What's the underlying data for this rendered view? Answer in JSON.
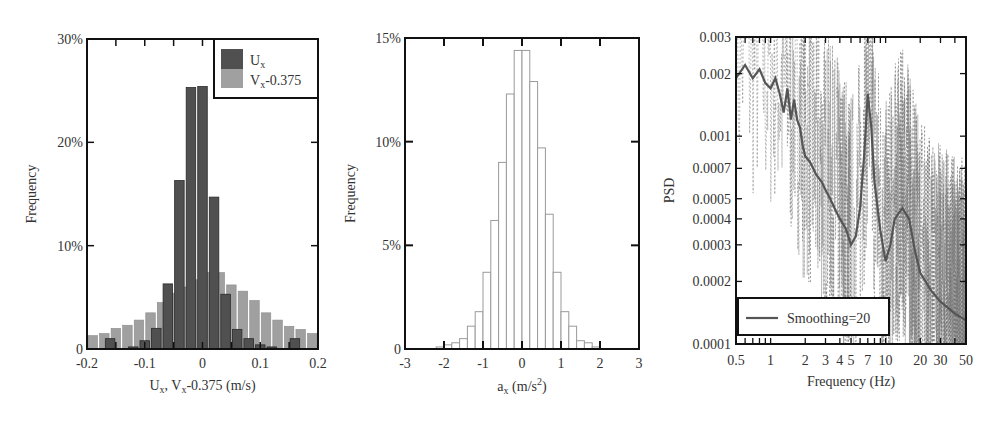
{
  "chart_data": [
    {
      "type": "bar",
      "title": "",
      "xlabel": "U_x, V_x-0.375 (m/s)",
      "ylabel": "Frequency",
      "xlim": [
        -0.2,
        0.2
      ],
      "ylim": [
        0,
        30
      ],
      "x_ticks": [
        "-0.2",
        "-0.1",
        "0",
        "0.1",
        "0.2"
      ],
      "y_ticks": [
        "0",
        "10%",
        "20%",
        "30%"
      ],
      "legend_position": "upper right",
      "series": [
        {
          "name": "U_x",
          "color": "#505050",
          "x": [
            -0.16,
            -0.12,
            -0.1,
            -0.08,
            -0.06,
            -0.04,
            -0.02,
            0.0,
            0.02,
            0.04,
            0.06,
            0.08,
            0.1,
            0.12,
            0.16
          ],
          "values": [
            1.0,
            0.2,
            0.8,
            2.0,
            6.3,
            16.3,
            25.3,
            25.4,
            14.7,
            5.3,
            1.9,
            1.0,
            0.4,
            0.2,
            1.0
          ]
        },
        {
          "name": "V_x-0.375",
          "color": "#a0a0a0",
          "x": [
            -0.19,
            -0.17,
            -0.15,
            -0.13,
            -0.11,
            -0.09,
            -0.07,
            -0.05,
            -0.03,
            -0.01,
            0.01,
            0.03,
            0.05,
            0.07,
            0.09,
            0.11,
            0.13,
            0.15,
            0.17,
            0.19
          ],
          "values": [
            1.3,
            1.5,
            2.0,
            2.3,
            2.8,
            3.5,
            4.5,
            5.4,
            6.0,
            6.7,
            7.4,
            7.4,
            6.2,
            5.6,
            4.7,
            3.5,
            2.8,
            2.2,
            1.9,
            1.5
          ]
        }
      ]
    },
    {
      "type": "bar",
      "title": "",
      "xlabel": "a_x (m/s^2)",
      "ylabel": "Frequency",
      "xlim": [
        -3,
        3
      ],
      "ylim": [
        0,
        15
      ],
      "x_ticks": [
        "-3",
        "-2",
        "-1",
        "0",
        "1",
        "2",
        "3"
      ],
      "y_ticks": [
        "0",
        "5%",
        "10%",
        "15%"
      ],
      "series": [
        {
          "name": "a_x",
          "color": "#ffffff",
          "edge_color": "#9a9a9a",
          "bin_width": 0.2,
          "x": [
            -2.1,
            -1.9,
            -1.7,
            -1.5,
            -1.3,
            -1.1,
            -0.9,
            -0.7,
            -0.5,
            -0.3,
            -0.1,
            0.1,
            0.3,
            0.5,
            0.7,
            0.9,
            1.1,
            1.3,
            1.5,
            1.7,
            1.9
          ],
          "values": [
            0.1,
            0.2,
            0.3,
            0.5,
            1.1,
            1.8,
            3.7,
            6.2,
            9.0,
            12.3,
            14.4,
            14.4,
            12.9,
            9.7,
            6.5,
            3.7,
            1.8,
            1.1,
            0.4,
            0.3,
            0.1
          ]
        }
      ]
    },
    {
      "type": "line",
      "title": "",
      "xlabel": "Frequency (Hz)",
      "ylabel": "PSD",
      "xscale": "log",
      "yscale": "log",
      "xlim": [
        0.5,
        50
      ],
      "ylim": [
        0.0001,
        0.003
      ],
      "x_ticks": [
        "0.5",
        "1",
        "2",
        "3",
        "4",
        "5",
        "7",
        "10",
        "20",
        "30",
        "50"
      ],
      "y_ticks": [
        "0.0001",
        "0.0002",
        "0.0003",
        "0.0004",
        "0.0005",
        "0.0007",
        "0.001",
        "0.002",
        "0.003"
      ],
      "legend_position": "lower left",
      "series": [
        {
          "name": "Smoothing=20",
          "style": "solid",
          "color": "#555555",
          "x": [
            0.5,
            0.6,
            0.7,
            0.8,
            0.9,
            1.0,
            1.1,
            1.2,
            1.3,
            1.4,
            1.5,
            1.6,
            1.7,
            1.8,
            1.9,
            2.0,
            2.2,
            2.5,
            2.8,
            3.0,
            3.3,
            3.6,
            4.0,
            4.5,
            5.0,
            5.5,
            6.0,
            6.5,
            7.0,
            7.5,
            8.0,
            9.0,
            10,
            11,
            12,
            14,
            16,
            18,
            20,
            25,
            30,
            40,
            50
          ],
          "values": [
            0.0019,
            0.0022,
            0.0019,
            0.0021,
            0.0018,
            0.0017,
            0.0019,
            0.0016,
            0.0013,
            0.0017,
            0.0012,
            0.0015,
            0.0012,
            0.0011,
            0.0009,
            0.0008,
            0.00075,
            0.00065,
            0.0006,
            0.00055,
            0.0005,
            0.00045,
            0.0004,
            0.00036,
            0.0003,
            0.00033,
            0.00045,
            0.0008,
            0.0016,
            0.0011,
            0.0006,
            0.00035,
            0.00025,
            0.0003,
            0.0004,
            0.00045,
            0.0004,
            0.00028,
            0.00022,
            0.00018,
            0.00016,
            0.00014,
            0.00013
          ]
        },
        {
          "name": "raw PSD",
          "style": "dashed",
          "color": "#777777",
          "description": "Noisy raw PSD spanning the full range, with peaks near 7 Hz and ~15 Hz"
        }
      ]
    }
  ],
  "panels": {
    "left": {
      "ylabel": "Frequency",
      "xlabel_parts": {
        "u": "U",
        "sub1": "x",
        "mid": ", V",
        "sub2": "x",
        "rest": "-0.375 (m/s)"
      },
      "legend": [
        {
          "label_main": "U",
          "label_sub": "x",
          "label_rest": ""
        },
        {
          "label_main": "V",
          "label_sub": "x",
          "label_rest": "-0.375"
        }
      ]
    },
    "middle": {
      "ylabel": "Frequency",
      "xlabel_parts": {
        "a": "a",
        "sub": "x",
        "rest": " (m/s",
        "sup": "2",
        "close": ")"
      }
    },
    "right": {
      "ylabel": "PSD",
      "xlabel": "Frequency (Hz)",
      "legend_label": "Smoothing=20"
    }
  }
}
